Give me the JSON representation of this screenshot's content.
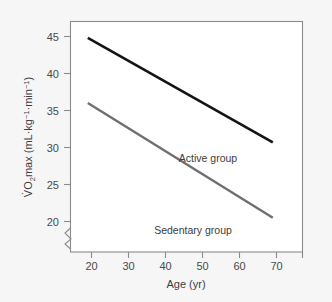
{
  "chart_data": {
    "type": "line",
    "title": "",
    "xlabel": "Age (yr)",
    "ylabel": "V̇O2max (mL·kg−1·min−1)",
    "ylabel_parts": {
      "lead": "V",
      "dot": "̇",
      "o": "O",
      "sub2": "2",
      "max": "max (mL·kg",
      "sup1": "−1",
      "mid": "·min",
      "sup2": "−1",
      "tail": ")"
    },
    "xlim": [
      15,
      75
    ],
    "ylim": [
      18,
      46.5
    ],
    "grid": false,
    "legend_position": "inline-annotation",
    "axis_break": {
      "axis": "y",
      "present": true,
      "below_value": 20
    },
    "xticks": [
      20,
      30,
      40,
      50,
      60,
      70
    ],
    "xticklabels": [
      "20",
      "30",
      "40",
      "50",
      "60",
      "70"
    ],
    "xtick_extra_unlabeled": [
      75
    ],
    "yticks": [
      20,
      25,
      30,
      35,
      40,
      45
    ],
    "yticklabels": [
      "20",
      "25",
      "30",
      "35",
      "40",
      "45"
    ],
    "series": [
      {
        "name": "Active group",
        "color": "#141414",
        "x": [
          19,
          69
        ],
        "values": [
          44.8,
          30.7
        ],
        "annotation": "Active group",
        "annotation_x": 52,
        "annotation_y": 28.4
      },
      {
        "name": "Sedentary group",
        "color": "#6f6f72",
        "x": [
          19,
          69
        ],
        "values": [
          36.0,
          20.5
        ],
        "annotation": "Sedentary group",
        "annotation_x": 47,
        "annotation_y": 18.9
      }
    ]
  },
  "colors": {
    "background": "#f6f6f7",
    "plot_background": "#ffffff",
    "frame": "#8b8b8f",
    "active_line": "#141414",
    "sedentary_line": "#6f6f72",
    "text": "#3c3c3e"
  }
}
